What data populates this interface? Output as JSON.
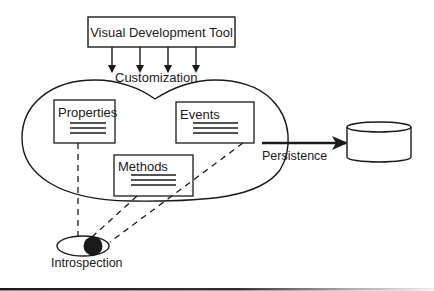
{
  "diagram": {
    "type": "component-architecture",
    "colors": {
      "stroke": "#1a1a1a",
      "background": "#ffffff"
    },
    "tool_box": {
      "label": "Visual Development Tool"
    },
    "customization": {
      "label": "Customization",
      "arrow_count": 4
    },
    "component": {
      "shape": "bean-blob",
      "boxes": [
        {
          "id": "properties",
          "label": "Properties",
          "lines": 3
        },
        {
          "id": "events",
          "label": "Events",
          "lines": 3
        },
        {
          "id": "methods",
          "label": "Methods",
          "lines": 3
        }
      ]
    },
    "persistence": {
      "label": "Persistence",
      "target": "database-cylinder-icon"
    },
    "introspection": {
      "label": "Introspection",
      "icon": "eye-icon"
    }
  }
}
